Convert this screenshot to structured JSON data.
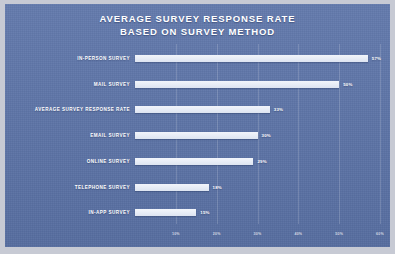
{
  "chart_data": {
    "type": "bar",
    "orientation": "horizontal",
    "title": "AVERAGE SURVEY RESPONSE RATE BASED ON SURVEY METHOD",
    "title_line1": "AVERAGE SURVEY RESPONSE RATE",
    "title_line2": "BASED ON SURVEY METHOD",
    "xlabel": "",
    "ylabel": "",
    "xlim": [
      0,
      60
    ],
    "grid": true,
    "legend": "none",
    "categories": [
      "IN-PERSON SURVEY",
      "MAIL SURVEY",
      "AVERAGE SURVEY RESPONSE RATE",
      "EMAIL SURVEY",
      "ONLINE SURVEY",
      "TELEPHONE SURVEY",
      "IN-APP SURVEY"
    ],
    "values": [
      57,
      50,
      33,
      30,
      29,
      18,
      15
    ],
    "value_labels": [
      "57%",
      "50%",
      "33%",
      "30%",
      "29%",
      "18%",
      "15%"
    ],
    "xticks": [
      10,
      20,
      30,
      40,
      50,
      60
    ],
    "xtick_labels": [
      "10%",
      "20%",
      "30%",
      "40%",
      "50%",
      "60%"
    ],
    "colors": {
      "background": "#5b73a8",
      "bar": "#e4e9f4",
      "text": "#ffffff",
      "gridline": "#7a8ebd",
      "page_margin": "#c7cad4"
    }
  }
}
